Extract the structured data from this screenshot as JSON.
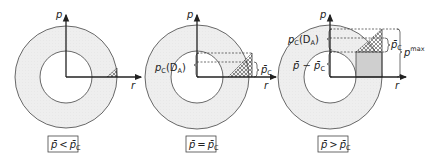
{
  "colors": {
    "ring_fill": "#ededed",
    "line": "#333333",
    "gray_fill": "#cfcfcf",
    "hatch": "#444444"
  },
  "panels": [
    {
      "id": "panel-1",
      "axis_p": "p",
      "axis_r": "r",
      "condition": {
        "lhs": "p̄",
        "op": "<",
        "rhs": "p̄",
        "rhs_sub": "C"
      }
    },
    {
      "id": "panel-2",
      "axis_p": "p",
      "axis_r": "r",
      "labels": {
        "pc_da": {
          "main": "p",
          "sub": "C",
          "arg": "(D",
          "arg_sub": "A",
          "close": ")"
        },
        "pbar_c": {
          "main": "p̄",
          "sub": "C"
        }
      },
      "condition": {
        "lhs": "p̄",
        "op": "=",
        "rhs": "p̄",
        "rhs_sub": "C"
      }
    },
    {
      "id": "panel-3",
      "axis_p": "p",
      "axis_r": "r",
      "labels": {
        "pc_da": {
          "main": "p",
          "sub": "C",
          "arg": "(D",
          "arg_sub": "A",
          "close": ")"
        },
        "pbar_minus_pbarc": {
          "a": "p̄",
          "op": " − ",
          "b": "p̄",
          "b_sub": "C"
        },
        "pbar_c": {
          "main": "p̄",
          "sub": "C"
        },
        "pmax": {
          "main": "p",
          "sup": "max"
        }
      },
      "condition": {
        "lhs": "p̄",
        "op": ">",
        "rhs": "p̄",
        "rhs_sub": "C"
      }
    }
  ]
}
